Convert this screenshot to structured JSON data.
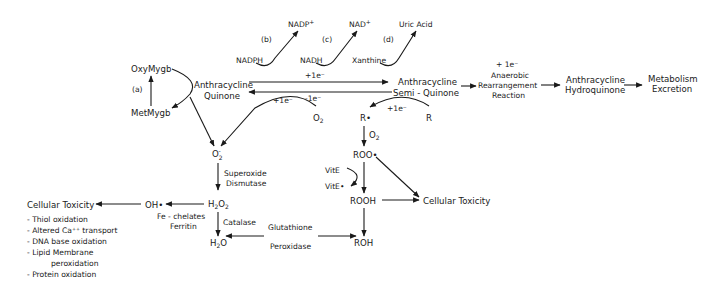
{
  "nodes": {
    "oxymygb": "OxyMygb",
    "metmygb": "MetMygb",
    "label_a": "(a)",
    "anthracycline_quinone": [
      "Anthracycline",
      "Quinone"
    ],
    "nadph": "NADPH",
    "nadp_plus": "NADP",
    "label_b": "(b)",
    "nadh": "NADH",
    "nad_plus": "NAD",
    "label_c": "(c)",
    "xanthine": "Xanthine",
    "uric_acid": "Uric Acid",
    "label_d": "(d)",
    "plus_charge": "+",
    "forward_electron": "+1e⁻",
    "reverse_electron": "-1e⁻",
    "o2_electron": "+1e⁻",
    "r_electron": "+1e⁻",
    "semiquinone": [
      "Anthracycline",
      "Semi - Quinone"
    ],
    "anaerobic": [
      "+ 1e⁻",
      "Anaerobic",
      "Rearrangement",
      "Reaction"
    ],
    "hydroquinone": [
      "Anthracycline",
      "Hydroquinone"
    ],
    "metabolism": [
      "Metabolism",
      "Excretion"
    ],
    "o2": "O",
    "superoxide": "O",
    "superoxide_dismutase": [
      "Superoxide",
      "Dismutase"
    ],
    "h2o2": [
      "H",
      "O"
    ],
    "catalase": "Catalase",
    "h2o": [
      "H",
      "O"
    ],
    "glutathione_peroxidase": [
      "Glutathione",
      "Peroxidase"
    ],
    "oh_radical": "OH•",
    "fe_chelates": [
      "Fe - chelates",
      "Ferritin"
    ],
    "r_radical": "R•",
    "r": "R",
    "o2_to_roo": "O",
    "roo_radical": "ROO•",
    "vite": "VitE",
    "vite_radical": "VitE•",
    "rooh": "ROOH",
    "roh": "ROH",
    "cellular_toxicity_right": "Cellular Toxicity",
    "cellular_toxicity_left": "Cellular Toxicity"
  },
  "toxicity_list": [
    "- Thiol oxidation",
    "- Altered Ca⁺⁺ transport",
    "- DNA base oxidation",
    "- Lipid Membrane",
    "peroxidation",
    "- Protein oxidation"
  ]
}
